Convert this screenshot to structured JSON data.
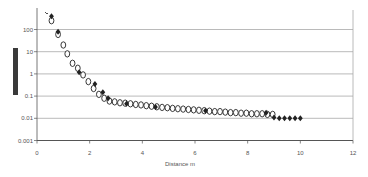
{
  "chart_data": {
    "type": "scatter",
    "title": "",
    "xlabel": "Distance m",
    "ylabel": "",
    "ylabel_redacted": true,
    "xlim": [
      0,
      12
    ],
    "ylim": [
      0.001,
      1000
    ],
    "yscale": "log",
    "grid": true,
    "legend": null,
    "x_ticks": [
      0,
      2,
      4,
      6,
      8,
      10,
      12
    ],
    "x_tick_labels": [
      "0",
      "2",
      "4",
      "6",
      "8",
      "10",
      "12"
    ],
    "y_ticks": [
      100,
      10,
      1,
      0.1,
      0.01,
      0.001
    ],
    "y_tick_labels": [
      "100",
      "10",
      "1",
      "0.1",
      "0.01",
      "0.001"
    ],
    "series": [
      {
        "name": "open-circles",
        "marker": "circle-open",
        "points": [
          [
            0.55,
            250
          ],
          [
            0.8,
            60
          ],
          [
            1.0,
            20
          ],
          [
            1.15,
            8
          ],
          [
            1.35,
            3
          ],
          [
            1.55,
            1.8
          ],
          [
            1.75,
            0.9
          ],
          [
            1.95,
            0.45
          ],
          [
            2.15,
            0.22
          ],
          [
            2.35,
            0.12
          ],
          [
            2.55,
            0.08
          ],
          [
            2.75,
            0.06
          ],
          [
            2.95,
            0.055
          ],
          [
            3.15,
            0.05
          ],
          [
            3.35,
            0.048
          ],
          [
            3.55,
            0.045
          ],
          [
            3.75,
            0.042
          ],
          [
            3.95,
            0.04
          ],
          [
            4.15,
            0.037
          ],
          [
            4.35,
            0.035
          ],
          [
            4.55,
            0.033
          ],
          [
            4.75,
            0.031
          ],
          [
            4.95,
            0.03
          ],
          [
            5.15,
            0.028
          ],
          [
            5.35,
            0.027
          ],
          [
            5.55,
            0.026
          ],
          [
            5.75,
            0.025
          ],
          [
            5.95,
            0.024
          ],
          [
            6.15,
            0.023
          ],
          [
            6.35,
            0.022
          ],
          [
            6.55,
            0.021
          ],
          [
            6.75,
            0.02
          ],
          [
            6.95,
            0.02
          ],
          [
            7.15,
            0.019
          ],
          [
            7.35,
            0.018
          ],
          [
            7.55,
            0.018
          ],
          [
            7.75,
            0.017
          ],
          [
            7.95,
            0.017
          ],
          [
            8.15,
            0.016
          ],
          [
            8.35,
            0.016
          ],
          [
            8.55,
            0.016
          ],
          [
            8.75,
            0.015
          ],
          [
            8.95,
            0.015
          ]
        ]
      },
      {
        "name": "filled-diamonds",
        "marker": "diamond-filled",
        "points": [
          [
            0.55,
            400
          ],
          [
            0.8,
            80
          ],
          [
            1.6,
            1.2
          ],
          [
            2.2,
            0.35
          ],
          [
            2.5,
            0.15
          ],
          [
            2.7,
            0.08
          ],
          [
            3.4,
            0.045
          ],
          [
            4.5,
            0.032
          ],
          [
            6.4,
            0.022
          ],
          [
            8.7,
            0.018
          ],
          [
            9.0,
            0.011
          ],
          [
            9.2,
            0.01
          ],
          [
            9.4,
            0.01
          ],
          [
            9.6,
            0.01
          ],
          [
            9.8,
            0.01
          ],
          [
            10.0,
            0.01
          ]
        ]
      }
    ]
  },
  "colors": {
    "grid": "#a8a8a8",
    "axis": "#555555",
    "marker": "#222222",
    "redaction": "#3a3a3a"
  }
}
